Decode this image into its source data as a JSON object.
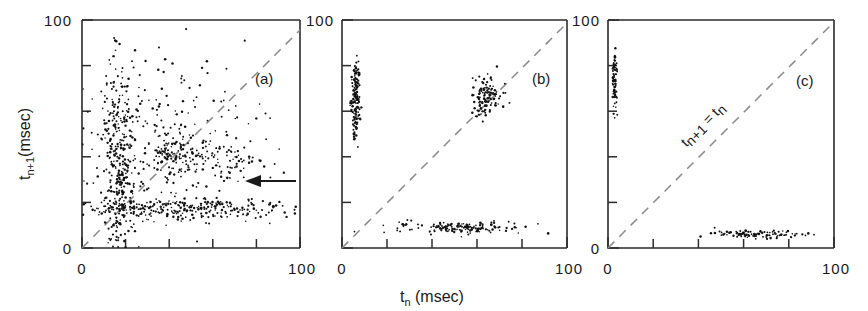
{
  "figure": {
    "title": "",
    "axis_labels": {
      "x": "t_n (msec)",
      "x_main": "t",
      "x_sub": "n",
      "x_unit": "(msec)",
      "y_main": "t",
      "y_sub": "n+1",
      "y_unit": "(msec)"
    },
    "diagonal_label": {
      "left_main": "t",
      "left_sub": "n+1",
      "equals": "=",
      "right_main": "t",
      "right_sub": "n"
    },
    "annotation_arrow": {
      "name": "left-pointing-arrow",
      "panel": "a",
      "x_data": 82,
      "y_data": 29
    },
    "colors": {
      "axis": "#2b2b2b",
      "data": "#111111",
      "diagonal": "#8a8a8a",
      "background": "#ffffff"
    }
  },
  "chart_data": [
    {
      "type": "scatter",
      "panel": "(a)",
      "title": "",
      "xlabel": "t_n (msec)",
      "ylabel": "t_n+1 (msec)",
      "xlim": [
        0,
        100
      ],
      "ylim": [
        0,
        100
      ],
      "xticks": [
        0,
        20,
        40,
        60,
        80,
        100
      ],
      "xticklabels": [
        "0",
        "",
        "",
        "",
        "",
        "100"
      ],
      "yticks": [
        0,
        20,
        40,
        60,
        80,
        100
      ],
      "yticklabels": [
        "0",
        "",
        "",
        "",
        "",
        "100"
      ],
      "grid": false,
      "legend": "none",
      "reference_line": {
        "type": "identity",
        "style": "dashed",
        "from": [
          0,
          0
        ],
        "to": [
          100,
          100
        ]
      },
      "description": "Dense broadly scattered cloud with a strong vertical band near t_n = 17 and a strong horizontal band near t_n+1 = 17, plus diffuse cloud between 20 and 75 msec",
      "clusters": [
        {
          "name": "vertical-band",
          "x_center": 17,
          "y_center": 35,
          "x_spread": 3.5,
          "y_spread": 22,
          "n": 320
        },
        {
          "name": "horizontal-band",
          "x_center": 45,
          "y_center": 17,
          "x_spread": 28,
          "y_spread": 2.5,
          "n": 300
        },
        {
          "name": "diffuse-cloud",
          "x_center": 40,
          "y_center": 48,
          "x_spread": 18,
          "y_spread": 18,
          "n": 260
        },
        {
          "name": "diagonal-knot",
          "x_center": 40,
          "y_center": 42,
          "x_spread": 4,
          "y_spread": 4,
          "n": 60
        },
        {
          "name": "right-arm",
          "x_center": 60,
          "y_center": 38,
          "x_spread": 12,
          "y_spread": 4,
          "n": 90
        }
      ]
    },
    {
      "type": "scatter",
      "panel": "(b)",
      "title": "",
      "xlabel": "t_n (msec)",
      "ylabel": "t_n+1 (msec)",
      "xlim": [
        0,
        100
      ],
      "ylim": [
        0,
        100
      ],
      "xticks": [
        0,
        20,
        40,
        60,
        80,
        100
      ],
      "xticklabels": [
        "0",
        "",
        "",
        "",
        "",
        "100"
      ],
      "yticks": [
        0,
        20,
        40,
        60,
        80,
        100
      ],
      "yticklabels": [
        "0",
        "",
        "",
        "",
        "",
        "100"
      ],
      "grid": false,
      "legend": "none",
      "reference_line": {
        "type": "identity",
        "style": "dashed",
        "from": [
          0,
          0
        ],
        "to": [
          100,
          100
        ]
      },
      "description": "Period-2-like alternation: a tight vertical segment at small t_n with large t_n+1, a tight horizontal segment at large t_n with small t_n+1, and a fixed-point knot on the diagonal near 64 msec",
      "clusters": [
        {
          "name": "vertical-segment",
          "x_center": 6,
          "y_center": 65,
          "x_spread": 1.0,
          "y_spread": 8,
          "n": 150
        },
        {
          "name": "horizontal-segment",
          "x_center": 52,
          "y_center": 9,
          "x_spread": 14,
          "y_spread": 1.2,
          "n": 150
        },
        {
          "name": "diagonal-knot",
          "x_center": 64,
          "y_center": 67,
          "x_spread": 3.5,
          "y_spread": 5,
          "n": 120
        }
      ]
    },
    {
      "type": "scatter",
      "panel": "(c)",
      "title": "",
      "xlabel": "t_n (msec)",
      "ylabel": "t_n+1 (msec)",
      "xlim": [
        0,
        100
      ],
      "ylim": [
        0,
        100
      ],
      "xticks": [
        0,
        20,
        40,
        60,
        80,
        100
      ],
      "xticklabels": [
        "0",
        "",
        "",
        "",
        "",
        "100"
      ],
      "yticks": [
        0,
        20,
        40,
        60,
        80,
        100
      ],
      "yticklabels": [
        "0",
        "",
        "",
        "",
        "",
        "100"
      ],
      "grid": false,
      "legend": "none",
      "reference_line": {
        "type": "identity",
        "style": "dashed",
        "from": [
          0,
          0
        ],
        "to": [
          100,
          100
        ]
      },
      "description": "Clean period-2 orbit: short vertical segment at very small t_n with large t_n+1, and a short horizontal segment at large t_n with very small t_n+1",
      "clusters": [
        {
          "name": "vertical-segment",
          "x_center": 3,
          "y_center": 73,
          "x_spread": 0.6,
          "y_spread": 6,
          "n": 70
        },
        {
          "name": "horizontal-segment",
          "x_center": 65,
          "y_center": 6,
          "x_spread": 9,
          "y_spread": 0.8,
          "n": 90
        }
      ]
    }
  ],
  "panels": [
    {
      "tag": "(a)",
      "tag_x": 255,
      "tag_y": 78,
      "left": 82,
      "right": 300,
      "top": 20,
      "bottom": 248
    },
    {
      "tag": "(b)",
      "tag_x": 532,
      "tag_y": 78,
      "left": 342,
      "right": 567,
      "top": 20,
      "bottom": 248
    },
    {
      "tag": "(c)",
      "tag_x": 799,
      "tag_y": 80,
      "left": 608,
      "right": 834,
      "top": 20,
      "bottom": 248
    }
  ],
  "tick_labels": {
    "origin": "0",
    "max": "100"
  }
}
